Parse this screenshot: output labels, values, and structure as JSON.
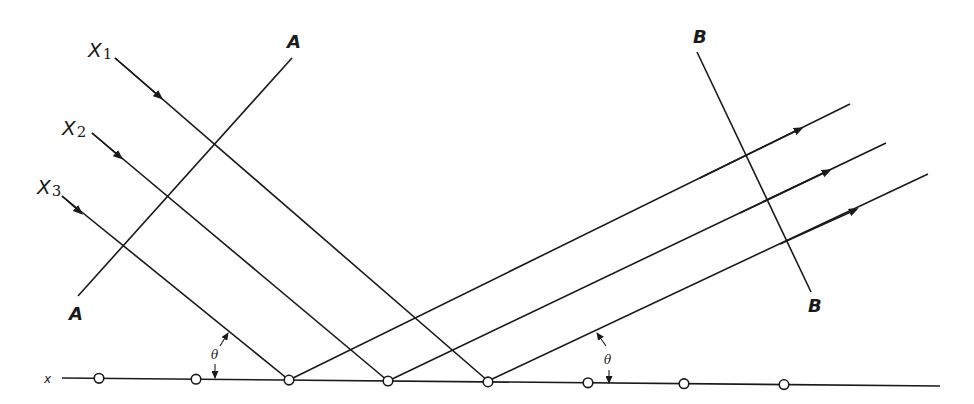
{
  "diagram": {
    "type": "x-ray diffraction / Bragg reflection from a row of atoms",
    "labels": {
      "incident_rays": [
        "X",
        "X",
        "X"
      ],
      "incident_subscripts": [
        "1",
        "2",
        "3"
      ],
      "wavefront_in": "A",
      "wavefront_out": "B",
      "angle": "θ",
      "row": "x"
    },
    "colors": {
      "ink": "#1a1a1a",
      "background": "#ffffff"
    },
    "atom_count": 8
  }
}
